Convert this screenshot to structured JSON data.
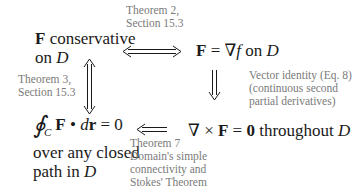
{
  "nodes": {
    "top_left": {
      "bold": "F",
      "line1_rest": " conservative",
      "line2_prefix": "on ",
      "line2_var": "D"
    },
    "top_right": {
      "bold_F": "F",
      "eq": " = ",
      "grad": "∇",
      "f": "f",
      "on": " on ",
      "D": "D"
    },
    "bottom_left": {
      "oint": "∮",
      "sub": "C",
      "F": "F",
      "dot": " • ",
      "d": "d",
      "r": "r",
      "eq0": " = 0",
      "line2": "over any closed",
      "line3_prefix": "path in ",
      "line3_var": "D"
    },
    "bottom_right": {
      "nabla": "∇",
      "times": " × ",
      "F": "F",
      "eq": " = ",
      "zero": "0",
      "throughout": " throughout ",
      "D": "D"
    }
  },
  "annotations": {
    "top": [
      "Theorem 2,",
      "Section 15.3"
    ],
    "left": [
      "Theorem 3,",
      "Section 15.3"
    ],
    "right": [
      "Vector identity (Eq. 8)",
      "(continuous second",
      "partial derivatives)"
    ],
    "bottom": [
      "Theorem 7",
      "Domain's simple",
      "connectivity and",
      "Stokes' Theorem"
    ]
  },
  "colors": {
    "main_text": "#1a1a1a",
    "annotation_text": "#7a7a7a"
  }
}
